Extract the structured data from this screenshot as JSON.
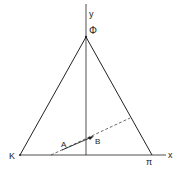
{
  "diagram": {
    "type": "ternary-triangle",
    "axes": {
      "x_label": "x",
      "y_label": "y"
    },
    "vertices": {
      "top": "Φ",
      "left": "K",
      "right": "π"
    },
    "points": {
      "A": "A",
      "B": "B"
    },
    "colors": {
      "line": "#222222",
      "dashed": "#444444"
    }
  }
}
